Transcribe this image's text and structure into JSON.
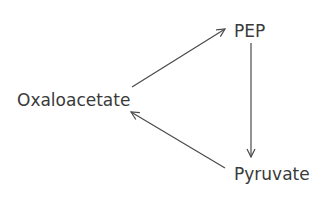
{
  "diagram": {
    "type": "cycle",
    "nodes": {
      "pep": {
        "label": "PEP"
      },
      "oxaloacetate": {
        "label": "Oxaloacetate"
      },
      "pyruvate": {
        "label": "Pyruvate"
      }
    },
    "edges": [
      {
        "from": "Oxaloacetate",
        "to": "PEP"
      },
      {
        "from": "PEP",
        "to": "Pyruvate"
      },
      {
        "from": "Pyruvate",
        "to": "Oxaloacetate"
      }
    ],
    "colors": {
      "stroke": "#4a4a4a",
      "text": "#3a3a3a",
      "background": "#ffffff"
    }
  }
}
